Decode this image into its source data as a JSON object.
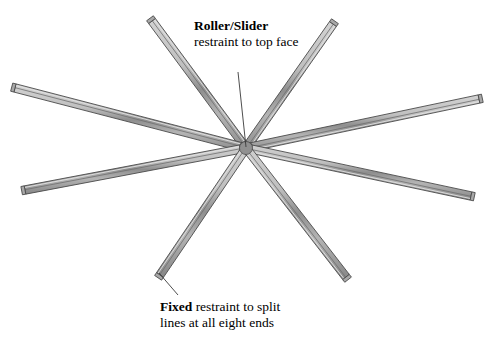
{
  "figure": {
    "type": "engineering-diagram",
    "background_color": "#ffffff"
  },
  "annotations": {
    "roller": {
      "title": "Roller/Slider",
      "body": "restraint to top face",
      "leader_from": "238,72",
      "leader_to": "246,147"
    },
    "fixed": {
      "title": "Fixed",
      "line1_rest": " restraint to split",
      "line2": "lines at all eight ends",
      "leader_from": "178,295",
      "leader_to": "159,273"
    }
  },
  "geometry": {
    "hub": {
      "x": 246,
      "y": 148
    },
    "beam_count": 8,
    "beam_half_width": 4.2,
    "beams": [
      {
        "name": "beam-top-left",
        "end_x": 152,
        "end_y": 21
      },
      {
        "name": "beam-top-right",
        "end_x": 333,
        "end_y": 24
      },
      {
        "name": "beam-left-upper",
        "end_x": 15,
        "end_y": 88
      },
      {
        "name": "beam-right-upper",
        "end_x": 479,
        "end_y": 99
      },
      {
        "name": "beam-left-lower",
        "end_x": 25,
        "end_y": 190
      },
      {
        "name": "beam-right-lower",
        "end_x": 471,
        "end_y": 196
      },
      {
        "name": "beam-bottom-left",
        "end_x": 160,
        "end_y": 275
      },
      {
        "name": "beam-bottom-right",
        "end_x": 346,
        "end_y": 277
      }
    ]
  },
  "colors": {
    "beam_face_light": "#c9c9c9",
    "beam_face_mid": "#a8a8a8",
    "beam_face_dark": "#787878",
    "beam_outline": "#4a4a4a",
    "hub_fill": "#909090",
    "leader_line": "#3a3a3a",
    "text": "#000000"
  }
}
